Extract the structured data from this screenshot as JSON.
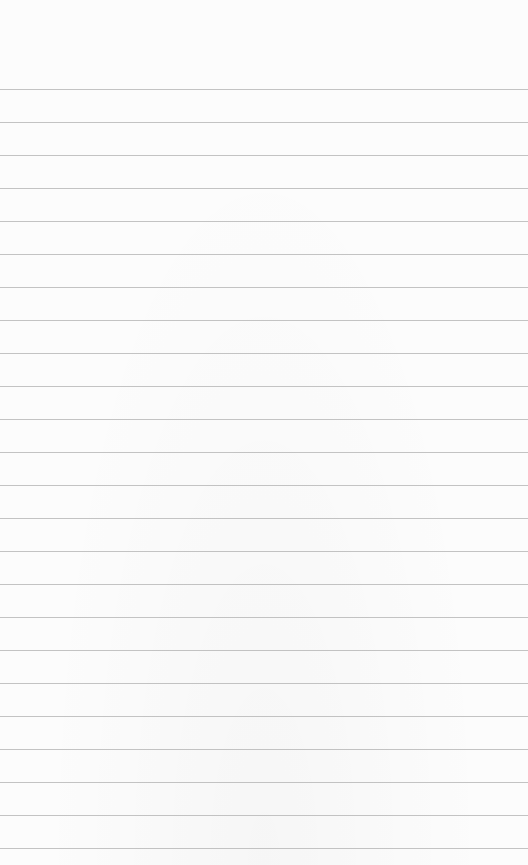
{
  "sheet": {
    "type": "ruled-paper",
    "background_color": "#fcfcfc",
    "line_color": "#b9b9b9",
    "first_line_y": 89,
    "line_spacing": 33,
    "line_count": 24,
    "text_lines": []
  }
}
